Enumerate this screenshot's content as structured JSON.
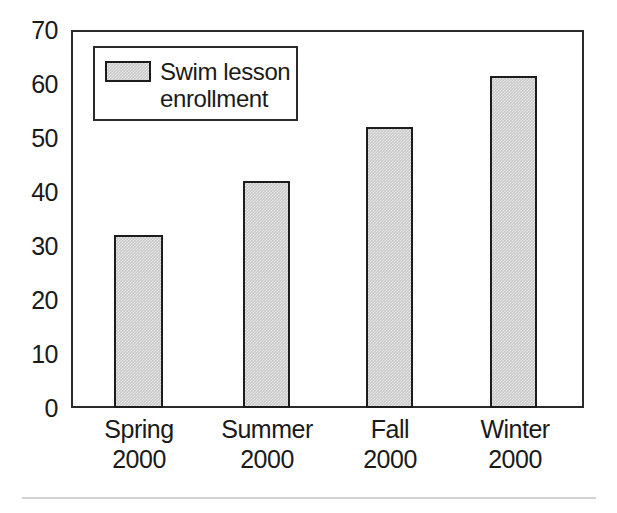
{
  "chart_data": {
    "type": "bar",
    "title": "",
    "subtitle": "",
    "xlabel": "",
    "ylabel": "",
    "categories": [
      "Spring\n2000",
      "Summer\n2000",
      "Fall\n2000",
      "Winter\n2000"
    ],
    "category_names": [
      "Spring",
      "Summer",
      "Fall",
      "Winter"
    ],
    "category_years": [
      "2000",
      "2000",
      "2000",
      "2000"
    ],
    "values": [
      32,
      42,
      52,
      61.5
    ],
    "series": [
      {
        "name": "Swim lesson enrollment",
        "values": [
          32,
          42,
          52,
          61.5
        ],
        "color": "#c9c9c9"
      }
    ],
    "ylim": [
      0,
      70
    ],
    "yticks": [
      0,
      10,
      20,
      30,
      40,
      50,
      60,
      70
    ],
    "ytick_labels": [
      "0",
      "10",
      "20",
      "30",
      "40",
      "50",
      "60",
      "70"
    ],
    "grid": false,
    "legend_position": "upper-left-inside",
    "legend_entries": [
      {
        "label_line1": "Swim lesson",
        "label_line2": "enrollment",
        "label": "Swim lesson enrollment",
        "swatch_color": "#c9c9c9"
      }
    ],
    "annotations": []
  },
  "axes": {
    "y_ticks": [
      {
        "label": "70",
        "value": 70
      },
      {
        "label": "60",
        "value": 60
      },
      {
        "label": "50",
        "value": 50
      },
      {
        "label": "40",
        "value": 40
      },
      {
        "label": "30",
        "value": 30
      },
      {
        "label": "20",
        "value": 20
      },
      {
        "label": "10",
        "value": 10
      },
      {
        "label": "0",
        "value": 0
      }
    ]
  },
  "colors": {
    "bar_fill": "#c9c9c9",
    "bar_stroke": "#1c1c1c",
    "frame": "#2b2b2b",
    "text": "#1a1a1a",
    "background": "#ffffff",
    "footer_rule": "#d2d2d2"
  }
}
